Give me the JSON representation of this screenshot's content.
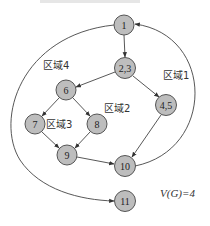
{
  "diagram": {
    "title": "",
    "nodes": [
      {
        "id": "n1",
        "label": "1",
        "x": 124,
        "y": 25
      },
      {
        "id": "n23",
        "label": "2,3",
        "x": 125,
        "y": 68
      },
      {
        "id": "n45",
        "label": "4,5",
        "x": 166,
        "y": 105
      },
      {
        "id": "n6",
        "label": "6",
        "x": 66,
        "y": 90
      },
      {
        "id": "n7",
        "label": "7",
        "x": 35,
        "y": 124
      },
      {
        "id": "n8",
        "label": "8",
        "x": 97,
        "y": 124
      },
      {
        "id": "n9",
        "label": "9",
        "x": 67,
        "y": 155
      },
      {
        "id": "n10",
        "label": "10",
        "x": 125,
        "y": 166
      },
      {
        "id": "n11",
        "label": "11",
        "x": 125,
        "y": 201
      }
    ],
    "edges": [
      {
        "from": "1",
        "to": "2,3"
      },
      {
        "from": "2,3",
        "to": "6"
      },
      {
        "from": "2,3",
        "to": "4,5"
      },
      {
        "from": "6",
        "to": "7"
      },
      {
        "from": "6",
        "to": "8"
      },
      {
        "from": "7",
        "to": "9"
      },
      {
        "from": "8",
        "to": "9"
      },
      {
        "from": "9",
        "to": "10"
      },
      {
        "from": "4,5",
        "to": "10"
      },
      {
        "from": "10",
        "to": "1"
      },
      {
        "from": "1",
        "to": "11"
      }
    ],
    "regions": [
      {
        "label": "区域1",
        "x": 163,
        "y": 79
      },
      {
        "label": "区域2",
        "x": 104,
        "y": 112
      },
      {
        "label": "区域3",
        "x": 46,
        "y": 128
      },
      {
        "label": "区域4",
        "x": 43,
        "y": 69
      }
    ],
    "formula": "V(G)=4",
    "node_fill": "#bdbdbd",
    "node_stroke": "#555555",
    "edge_color": "#444444"
  }
}
